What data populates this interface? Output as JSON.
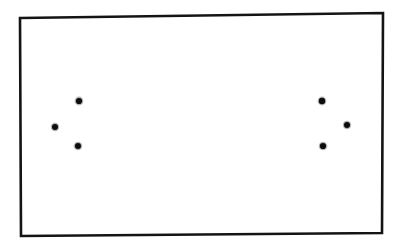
{
  "figure": {
    "background_color": "#ffffff",
    "ink_color": "#0d0d0d"
  },
  "frame": {
    "label": "Rectangular border",
    "stroke_color": "#141414",
    "stroke_width": 2.6,
    "fill_color": "#ffffff",
    "corners": [
      {
        "name": "top-left",
        "x": 20,
        "y": 18
      },
      {
        "name": "top-right",
        "x": 383,
        "y": 13
      },
      {
        "name": "bottom-right",
        "x": 382,
        "y": 233
      },
      {
        "name": "bottom-left",
        "x": 21,
        "y": 236
      }
    ]
  },
  "chart_data": {
    "type": "scatter",
    "xlabel": "",
    "ylabel": "",
    "xlim": [
      0,
      403
    ],
    "ylim": [
      0,
      252
    ],
    "grid": false,
    "legend": "none",
    "point_color": "#0d0d0d",
    "point_radius": 3.1,
    "series": [
      {
        "name": "left-cluster",
        "points": [
          {
            "id": "left-top",
            "x": 79,
            "y": 101
          },
          {
            "id": "left-outer",
            "x": 55,
            "y": 127
          },
          {
            "id": "left-bottom",
            "x": 78,
            "y": 146
          }
        ]
      },
      {
        "name": "right-cluster",
        "points": [
          {
            "id": "right-top",
            "x": 322,
            "y": 101
          },
          {
            "id": "right-outer",
            "x": 347,
            "y": 125
          },
          {
            "id": "right-bottom",
            "x": 323,
            "y": 146
          }
        ]
      }
    ]
  }
}
